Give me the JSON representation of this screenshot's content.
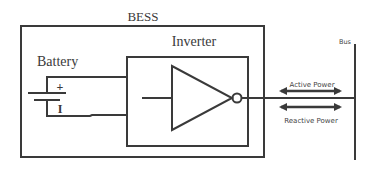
{
  "diagram": {
    "title_label": "BESS",
    "battery_label": "Battery",
    "battery_plus": "+",
    "battery_minus": "I",
    "inverter_label": "Inverter",
    "bus_label": "Bus",
    "active_power_label": "Active Power",
    "reactive_power_label": "Reactive Power"
  },
  "colors": {
    "line": "#3a3a3a",
    "background": "#ffffff"
  }
}
